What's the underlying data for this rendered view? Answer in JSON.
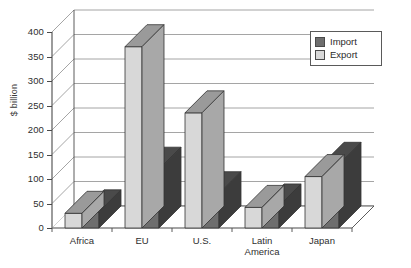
{
  "chart_data": {
    "type": "bar",
    "title": "",
    "subtitle": "",
    "xlabel": "",
    "ylabel": "$ billion",
    "ylim": [
      0,
      400
    ],
    "yticks": [
      0,
      50,
      100,
      150,
      200,
      250,
      300,
      350,
      400
    ],
    "grid": true,
    "three_d": true,
    "legend_position": "top-right",
    "bar_order_in_group": [
      "Export",
      "Import"
    ],
    "categories": [
      "Africa",
      "EU",
      "U.S.",
      "Latin America",
      "Japan"
    ],
    "category_labels": [
      [
        "Africa"
      ],
      [
        "EU"
      ],
      [
        "U.S."
      ],
      [
        "Latin",
        "America"
      ],
      [
        "Japan"
      ]
    ],
    "series": [
      {
        "name": "Import",
        "color": "#6e6e6e",
        "values": [
          33,
          120,
          70,
          45,
          130
        ]
      },
      {
        "name": "Export",
        "color": "#d8d8d8",
        "values": [
          30,
          370,
          235,
          42,
          105
        ]
      }
    ]
  },
  "legend": {
    "items": [
      {
        "label": "Import",
        "color": "#6e6e6e"
      },
      {
        "label": "Export",
        "color": "#d8d8d8"
      }
    ]
  },
  "axis": {
    "y_title": "$ billion",
    "y_tick_labels": [
      "400",
      "350",
      "300",
      "250",
      "200",
      "150",
      "100",
      "50",
      "0"
    ],
    "x_tick_labels": [
      "Africa",
      "EU",
      "U.S.",
      "Latin America",
      "Japan"
    ]
  },
  "colors": {
    "export_face": "#d8d8d8",
    "export_top": "#9a9a9a",
    "export_side": "#a8a8a8",
    "import_face": "#6e6e6e",
    "import_top": "#4a4a4a",
    "import_side": "#3c3c3c",
    "gridline": "#8e8e8e",
    "axis": "#4a4a4a",
    "wall": "#ffffff",
    "floor": "#ffffff",
    "text": "#2b2b2b"
  }
}
